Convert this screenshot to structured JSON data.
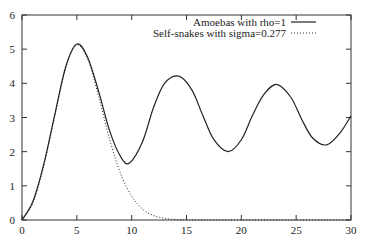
{
  "chart_data": {
    "type": "line",
    "title": "",
    "xlabel": "",
    "ylabel": "",
    "xlim": [
      0,
      30
    ],
    "ylim": [
      0,
      6
    ],
    "xticks": [
      0,
      5,
      10,
      15,
      20,
      25,
      30
    ],
    "yticks": [
      0,
      1,
      2,
      3,
      4,
      5,
      6
    ],
    "grid": false,
    "legend_position": "top-right",
    "series": [
      {
        "name": "Amoebas with rho=1",
        "style": "solid",
        "x": [
          0,
          1,
          2,
          3,
          4,
          5,
          6,
          7,
          8,
          9,
          9.8,
          11,
          12,
          13,
          14.3,
          15.5,
          16.5,
          17.5,
          18.8,
          20,
          21,
          22,
          23.2,
          24.5,
          25.5,
          26.5,
          27.8,
          29,
          30
        ],
        "y": [
          0,
          0.55,
          1.65,
          3.1,
          4.5,
          5.15,
          4.75,
          3.75,
          2.6,
          1.85,
          1.67,
          2.3,
          3.3,
          4.0,
          4.21,
          3.8,
          3.05,
          2.35,
          2.0,
          2.35,
          3.05,
          3.65,
          3.97,
          3.6,
          2.95,
          2.4,
          2.2,
          2.55,
          3.05
        ]
      },
      {
        "name": "Self-snakes with sigma=0.277",
        "style": "dotted",
        "x": [
          0,
          1,
          2,
          3,
          4,
          5,
          6,
          7,
          8,
          9,
          10,
          11,
          12,
          13,
          14,
          15,
          16,
          18,
          20,
          25,
          30
        ],
        "y": [
          0,
          0.5,
          1.6,
          3.05,
          4.45,
          5.12,
          4.7,
          3.6,
          2.35,
          1.35,
          0.7,
          0.32,
          0.13,
          0.05,
          0.015,
          0.004,
          0.001,
          0,
          0,
          0,
          0
        ]
      }
    ]
  }
}
